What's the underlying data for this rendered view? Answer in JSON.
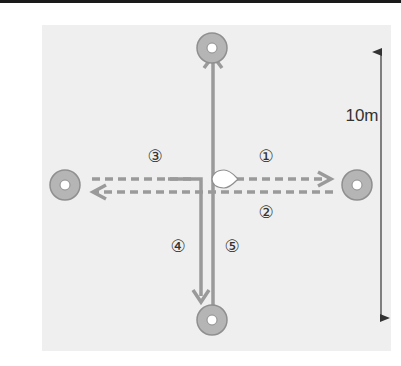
{
  "diagram": {
    "type": "drill-course",
    "distance_label": "10m",
    "path_labels": [
      "①",
      "②",
      "③",
      "④",
      "⑤"
    ],
    "colors": {
      "background_panel": "#efefef",
      "cone_fill": "#b5b5b5",
      "cone_stroke": "#8f8f8f",
      "path": "#9a9a9a",
      "scale_line": "#333333"
    },
    "cones": [
      {
        "id": "top",
        "cx": 212,
        "cy": 48
      },
      {
        "id": "left",
        "cx": 65,
        "cy": 185
      },
      {
        "id": "right",
        "cx": 357,
        "cy": 185
      },
      {
        "id": "bottom",
        "cx": 212,
        "cy": 320
      }
    ],
    "start_marker": "teardrop"
  }
}
